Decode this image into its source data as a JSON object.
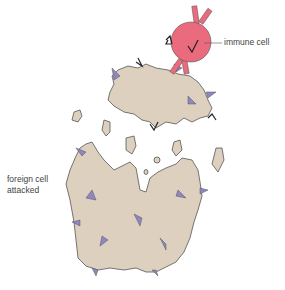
{
  "diagram": {
    "labels": {
      "immune_cell": "immune cell",
      "foreign_cell_line1": "foreign cell",
      "foreign_cell_line2": "attacked"
    },
    "colors": {
      "immune_cell": "#eb6b7e",
      "foreign_cell": "#ddd0bf",
      "outline": "#555555",
      "antigen": "#8f86c4",
      "antibody": "#eb6b7e"
    }
  }
}
